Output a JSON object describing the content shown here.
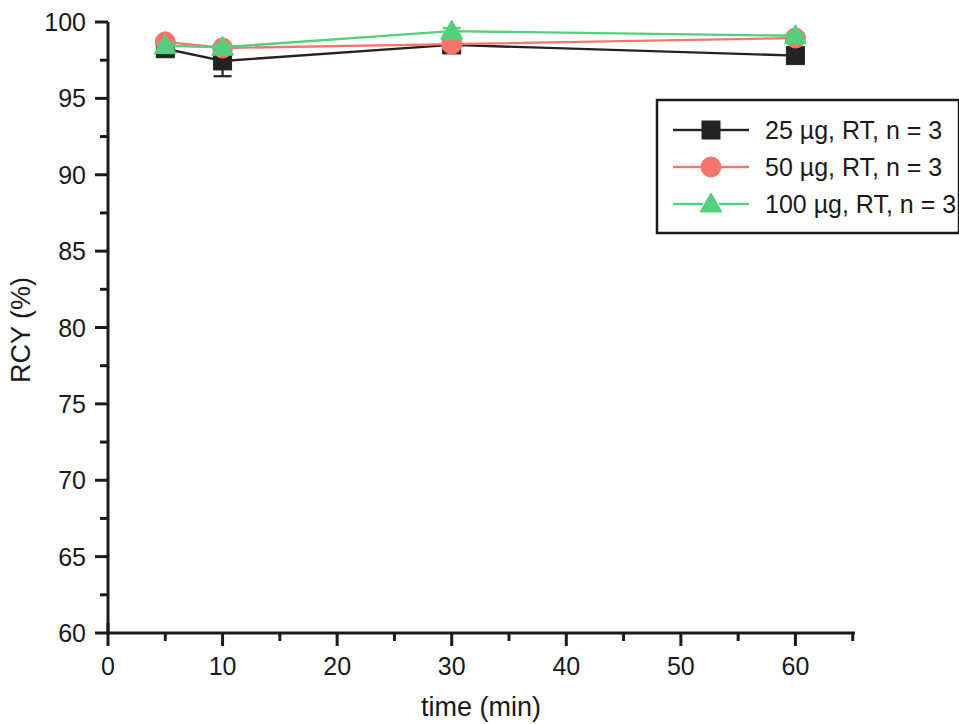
{
  "chart_data": {
    "type": "line",
    "title": "",
    "subtitle": "",
    "xlabel": "time (min)",
    "ylabel": "RCY (%)",
    "xlim": [
      0,
      65.2
    ],
    "ylim": [
      60,
      100
    ],
    "grid": false,
    "legend_position": "upper-right-inside",
    "x_ticks": [
      {
        "value": 0,
        "label": "0"
      },
      {
        "value": 10,
        "label": "10"
      },
      {
        "value": 20,
        "label": "20"
      },
      {
        "value": 30,
        "label": "30"
      },
      {
        "value": 40,
        "label": "40"
      },
      {
        "value": 50,
        "label": "50"
      },
      {
        "value": 60,
        "label": "60"
      }
    ],
    "x_minor_ticks": [
      5,
      15,
      25,
      35,
      45,
      55,
      65
    ],
    "y_ticks": [
      {
        "value": 100,
        "label": "100"
      },
      {
        "value": 95,
        "label": "95"
      },
      {
        "value": 90,
        "label": "90"
      },
      {
        "value": 85,
        "label": "85"
      },
      {
        "value": 80,
        "label": "80"
      },
      {
        "value": 75,
        "label": "75"
      },
      {
        "value": 70,
        "label": "70"
      },
      {
        "value": 65,
        "label": "65"
      },
      {
        "value": 60,
        "label": "60"
      }
    ],
    "y_minor_ticks": [
      62.5,
      67.5,
      72.5,
      77.5,
      82.5,
      87.5,
      92.5,
      97.5
    ],
    "x": [
      5,
      10,
      30,
      60
    ],
    "series": [
      {
        "name": "25 µg, RT, n = 3",
        "color": "#232323",
        "marker": "square",
        "values": [
          98.25,
          97.45,
          98.5,
          97.8
        ],
        "errors": [
          0.35,
          1.0,
          0.25,
          0.2
        ]
      },
      {
        "name": "50 µg, RT, n = 3",
        "color": "#F4766A",
        "marker": "circle",
        "values": [
          98.7,
          98.3,
          98.55,
          98.95
        ],
        "errors": [
          0.2,
          0.15,
          0.2,
          0.15
        ]
      },
      {
        "name": "100 µg, RT, n = 3",
        "color": "#54D07C",
        "marker": "triangle",
        "values": [
          98.45,
          98.35,
          99.4,
          99.1
        ],
        "errors": [
          0.2,
          0.15,
          0.2,
          0.15
        ]
      }
    ]
  },
  "legend": {
    "entries": [
      {
        "label": "25 µg, RT, n = 3"
      },
      {
        "label": "50 µg, RT, n = 3"
      },
      {
        "label": "100 µg, RT, n = 3"
      }
    ]
  },
  "axes": {
    "x_title": "time (min)",
    "y_title": "RCY (%)"
  },
  "colors": {
    "axis": "#1a1a1a",
    "series_25": "#232323",
    "series_50": "#F4766A",
    "series_100": "#54D07C",
    "background": "#ffffff"
  }
}
